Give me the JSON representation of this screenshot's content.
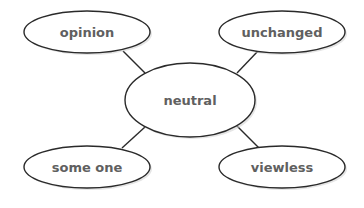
{
  "diagram": {
    "type": "word-web",
    "center": {
      "label": "neutral"
    },
    "nodes": [
      {
        "label": "opinion",
        "position": "top-left"
      },
      {
        "label": "unchanged",
        "position": "top-right"
      },
      {
        "label": "some one",
        "position": "bottom-left"
      },
      {
        "label": "viewless",
        "position": "bottom-right"
      }
    ],
    "colors": {
      "stroke": "#2a2a2a",
      "text": "#606060",
      "fill": "#ffffff"
    }
  }
}
